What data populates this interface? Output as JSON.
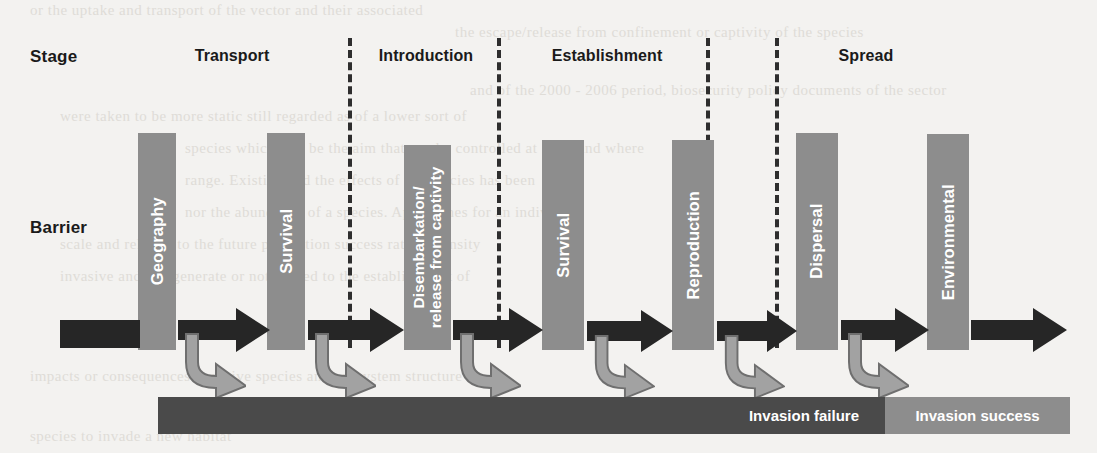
{
  "figure": {
    "row_labels": {
      "stage": "Stage",
      "barrier": "Barrier"
    },
    "stages": [
      {
        "name": "Transport",
        "label": "Transport"
      },
      {
        "name": "Introduction",
        "label": "Introduction"
      },
      {
        "name": "Establishment",
        "label": "Establishment"
      },
      {
        "name": "Spread",
        "label": "Spread"
      }
    ],
    "barriers": [
      {
        "id": "geography",
        "label": "Geography",
        "lines": [
          "Geography"
        ]
      },
      {
        "id": "survival-1",
        "label": "Survival",
        "lines": [
          "Survival"
        ]
      },
      {
        "id": "disembarkation",
        "label": "Disembarkation/release from captivity",
        "lines": [
          "Disembarkation/",
          "release from captivity"
        ]
      },
      {
        "id": "survival-2",
        "label": "Survival",
        "lines": [
          "Survival"
        ]
      },
      {
        "id": "reproduction",
        "label": "Reproduction",
        "lines": [
          "Reproduction"
        ]
      },
      {
        "id": "dispersal",
        "label": "Dispersal",
        "lines": [
          "Dispersal"
        ]
      },
      {
        "id": "environmental",
        "label": "Environmental",
        "lines": [
          "Environmental"
        ]
      }
    ],
    "outcomes": {
      "failure": "Invasion failure",
      "success": "Invasion success"
    },
    "colors": {
      "barrier_bar": "#8d8d8d",
      "flow_arrow": "#262626",
      "branch_arrow": "#9a9a9a",
      "failure_bar": "#4a4a4a",
      "success_bar": "#8d8d8d",
      "divider": "#2e2e2e",
      "text_dark": "#1a1a1a",
      "text_light": "#ffffff",
      "background": "#f3f2f0"
    },
    "ghost_text": [
      "or the uptake and transport of the vector and their associated",
      "the escape/release from confinement or captivity of the species",
      "and of the 2000 - 2006 period, biosecurity policy documents of the sector",
      "were taken to be more static still regarded as of a lower sort of",
      "species which will be the aim that can be controlled at 2001 and where",
      "range. Existing and the effects of the species has been",
      "nor the abundance of a species. Approaches for an individual",
      "scale and relative to the future population success rate or density",
      "invasive and can generate or not related to the establishment of",
      "impacts or consequences to native species and ecosystem structure",
      "species to invade a new habitat"
    ]
  }
}
